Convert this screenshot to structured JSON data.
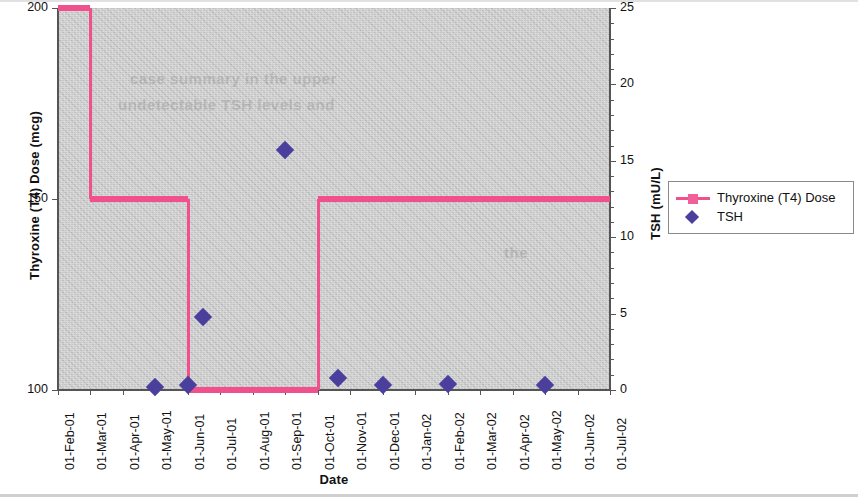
{
  "chart_data": {
    "type": "line",
    "title": "",
    "xlabel": "Date",
    "ylabel_left": "Thyroxine (T4) Dose (mcg)",
    "ylabel_right": "TSH (mU/L)",
    "x_categories": [
      "01-Feb-01",
      "01-Mar-01",
      "01-Apr-01",
      "01-May-01",
      "01-Jun-01",
      "01-Jul-01",
      "01-Aug-01",
      "01-Sep-01",
      "01-Oct-01",
      "01-Nov-01",
      "01-Dec-01",
      "01-Jan-02",
      "01-Feb-02",
      "01-Mar-02",
      "01-Apr-02",
      "01-May-02",
      "01-Jun-02",
      "01-Jul-02"
    ],
    "y_left_ticks": [
      "100",
      "150",
      "200"
    ],
    "y_left_lim": [
      100,
      200
    ],
    "y_right_ticks": [
      "0",
      "5",
      "10",
      "15",
      "20",
      "25"
    ],
    "y_right_lim": [
      0,
      25
    ],
    "grid": false,
    "legend_position": "right",
    "series": [
      {
        "name": "Thyroxine (T4) Dose",
        "type": "step",
        "axis": "left",
        "color": "#f0508c",
        "marker": "square",
        "steps": [
          {
            "from": "01-Feb-01",
            "to": "01-Mar-01",
            "value": 200
          },
          {
            "from": "01-Mar-01",
            "to": "01-Jun-01",
            "value": 150
          },
          {
            "from": "01-Jun-01",
            "to": "01-Oct-01",
            "value": 100
          },
          {
            "from": "01-Oct-01",
            "to": "01-Jul-02",
            "value": 150
          }
        ]
      },
      {
        "name": "TSH",
        "type": "scatter",
        "axis": "right",
        "color": "#4b3f9e",
        "marker": "diamond",
        "points": [
          {
            "x": "01-May-01",
            "value": 0.2
          },
          {
            "x": "01-Jun-01",
            "value": 0.3
          },
          {
            "x": "15-Jun-01",
            "value": 4.8
          },
          {
            "x": "01-Sep-01",
            "value": 15.7
          },
          {
            "x": "20-Oct-01",
            "value": 0.8
          },
          {
            "x": "01-Dec-01",
            "value": 0.3
          },
          {
            "x": "01-Feb-02",
            "value": 0.4
          },
          {
            "x": "01-May-02",
            "value": 0.3
          }
        ]
      }
    ]
  },
  "legend": {
    "items": [
      {
        "label": "Thyroxine (T4) Dose",
        "marker": "line-square",
        "color": "#f0508c"
      },
      {
        "label": "TSH",
        "marker": "diamond",
        "color": "#4b3f9e"
      }
    ]
  },
  "ghost_text": {
    "line1": "case   summary   in   the   upper",
    "line2": "undetectable   TSH   levels   and",
    "line3": "the"
  }
}
